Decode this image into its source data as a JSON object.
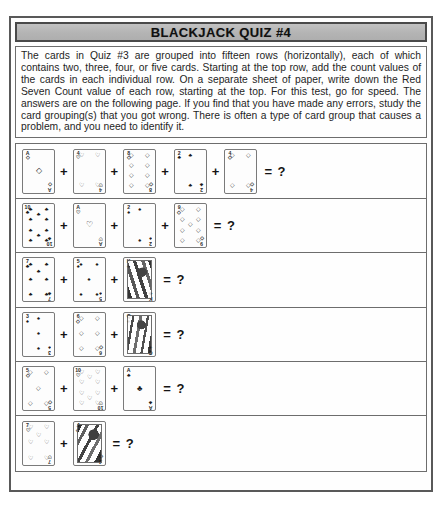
{
  "page": {
    "title": "BLACKJACK QUIZ #4",
    "intro": "The cards in Quiz #3 are grouped into fifteen rows (horizontally), each of which contains two, three, four, or five cards. Starting at the top row, add the count values of the cards in each individual row. On a separate sheet of paper, write down the Red Seven Count value of each row, starting at the top. For this test, go for speed. The answers are on the following page. If you find that you have made any errors, study the card grouping(s) that you got wrong. There is often a type of card group that causes a problem, and you need to identify it.",
    "plus_symbol": "+",
    "equals_symbol": "= ?",
    "suit_glyphs": {
      "spade": "♠",
      "heart": "♡",
      "diamond": "◇",
      "club": "♣"
    }
  },
  "quiz_rows": [
    {
      "index": 1,
      "cards": [
        {
          "rank": "A",
          "suit": "diamond",
          "color": "red"
        },
        {
          "rank": "4",
          "suit": "heart",
          "color": "red"
        },
        {
          "rank": "8",
          "suit": "diamond",
          "color": "red"
        },
        {
          "rank": "2",
          "suit": "club",
          "color": "black"
        },
        {
          "rank": "4",
          "suit": "diamond",
          "color": "red"
        }
      ]
    },
    {
      "index": 2,
      "cards": [
        {
          "rank": "10",
          "suit": "club",
          "color": "black"
        },
        {
          "rank": "A",
          "suit": "heart",
          "color": "red"
        },
        {
          "rank": "2",
          "suit": "spade",
          "color": "black"
        },
        {
          "rank": "9",
          "suit": "diamond",
          "color": "red"
        }
      ]
    },
    {
      "index": 3,
      "cards": [
        {
          "rank": "7",
          "suit": "club",
          "color": "black"
        },
        {
          "rank": "5",
          "suit": "spade",
          "color": "black"
        },
        {
          "rank": "K",
          "suit": "club",
          "color": "black",
          "face": true
        }
      ]
    },
    {
      "index": 4,
      "cards": [
        {
          "rank": "3",
          "suit": "spade",
          "color": "black"
        },
        {
          "rank": "6",
          "suit": "diamond",
          "color": "red"
        },
        {
          "rank": "Q",
          "suit": "spade",
          "color": "black",
          "face": true
        }
      ]
    },
    {
      "index": 5,
      "cards": [
        {
          "rank": "5",
          "suit": "diamond",
          "color": "red"
        },
        {
          "rank": "10",
          "suit": "heart",
          "color": "red"
        },
        {
          "rank": "A",
          "suit": "club",
          "color": "black"
        }
      ]
    },
    {
      "index": 6,
      "cards": [
        {
          "rank": "7",
          "suit": "heart",
          "color": "red"
        },
        {
          "rank": "J",
          "suit": "diamond",
          "color": "red",
          "face": true
        }
      ]
    }
  ]
}
